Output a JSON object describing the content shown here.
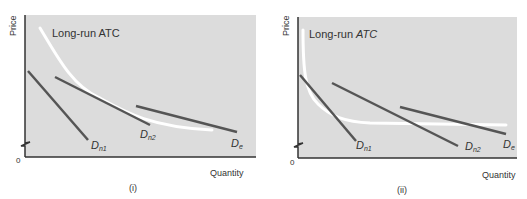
{
  "panels": [
    {
      "caption": "(i)",
      "y_label": "Price",
      "x_label": "Quantity",
      "origin_label": "0",
      "curve_label": "Long-run ATC",
      "demand_labels": [
        {
          "main": "D",
          "sub": "n1"
        },
        {
          "main": "D",
          "sub": "n2"
        },
        {
          "main": "D",
          "sub": "e"
        }
      ]
    },
    {
      "caption": "(ii)",
      "y_label": "Price",
      "x_label": "Quantity",
      "origin_label": "0",
      "curve_label_prefix": "Long-run ",
      "curve_label_italic": "ATC",
      "demand_labels": [
        {
          "main": "D",
          "sub": "n1"
        },
        {
          "main": "D",
          "sub": "n2"
        },
        {
          "main": "D",
          "sub": "e"
        }
      ]
    }
  ],
  "colors": {
    "panel_bg": "#dcdcdc",
    "axis": "#333333",
    "demand_line": "#555555",
    "atc_curve": "#ffffff"
  }
}
